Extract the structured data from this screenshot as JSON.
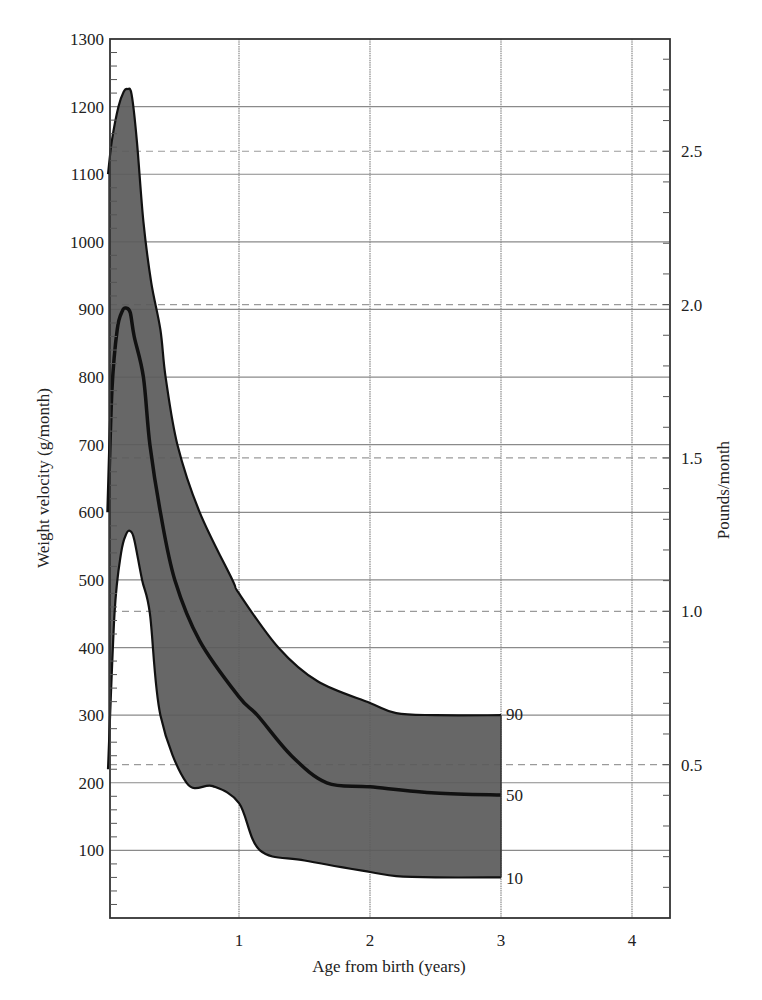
{
  "chart_data": {
    "type": "area",
    "title": "",
    "xlabel": "Age from birth (years)",
    "ylabel": "Weight velocity (g/month)",
    "y2label": "Pounds/month",
    "xlim": [
      0,
      4.3
    ],
    "ylim": [
      0,
      1300
    ],
    "x_ticks": [
      1,
      2,
      3,
      4
    ],
    "y_ticks": [
      100,
      200,
      300,
      400,
      500,
      600,
      700,
      800,
      900,
      1000,
      1100,
      1200,
      1300
    ],
    "y_minor_step": 20,
    "y2_ticks": [
      0.5,
      1.0,
      1.5,
      2.0,
      2.5
    ],
    "y2_tick_labels": [
      "0.5",
      "1.0",
      "1.5",
      "2.0",
      "2.5"
    ],
    "y2_minor_step": 0.1,
    "grams_per_pound": 453.6,
    "grid": true,
    "band_fill": "#5a5a5a",
    "series": [
      {
        "name": "90",
        "label": "90",
        "x": [
          0.0,
          0.03,
          0.08,
          0.12,
          0.15,
          0.18,
          0.22,
          0.27,
          0.33,
          0.4,
          0.44,
          0.53,
          0.7,
          0.95,
          1.0,
          1.3,
          1.6,
          2.0,
          2.2,
          2.5,
          3.0
        ],
        "values": [
          1100,
          1150,
          1200,
          1222,
          1226,
          1218,
          1150,
          1030,
          940,
          870,
          800,
          700,
          600,
          500,
          480,
          400,
          350,
          318,
          303,
          300,
          300
        ]
      },
      {
        "name": "50",
        "label": "50",
        "x": [
          0.0,
          0.03,
          0.07,
          0.11,
          0.14,
          0.17,
          0.2,
          0.27,
          0.32,
          0.4,
          0.51,
          0.7,
          1.0,
          1.14,
          1.4,
          1.67,
          2.0,
          2.5,
          3.0
        ],
        "values": [
          600,
          780,
          870,
          898,
          902,
          895,
          860,
          800,
          700,
          600,
          500,
          410,
          327,
          300,
          240,
          200,
          194,
          185,
          182
        ]
      },
      {
        "name": "10",
        "label": "10",
        "x": [
          0.0,
          0.05,
          0.1,
          0.14,
          0.17,
          0.2,
          0.26,
          0.32,
          0.4,
          0.6,
          0.8,
          1.0,
          1.16,
          1.5,
          2.0,
          2.2,
          2.5,
          3.0
        ],
        "values": [
          220,
          450,
          540,
          568,
          572,
          560,
          500,
          450,
          300,
          200,
          195,
          170,
          100,
          85,
          68,
          62,
          60,
          60
        ]
      }
    ]
  },
  "labels": {
    "xlabel": "Age from birth (years)",
    "ylabel": "Weight velocity (g/month)",
    "y2label": "Pounds/month",
    "p90": "90",
    "p50": "50",
    "p10": "10"
  }
}
